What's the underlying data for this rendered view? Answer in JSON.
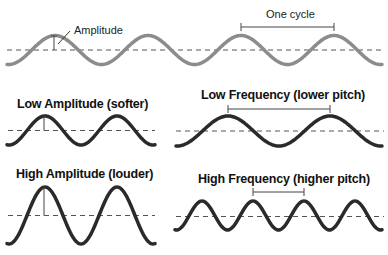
{
  "diagram": {
    "colors": {
      "reference_wave": "#8c8c8c",
      "example_wave": "#2a2a2a",
      "baseline": "#555555",
      "marker": "#444444"
    },
    "reference": {
      "amplitude_label": "Amplitude",
      "cycle_label": "One cycle",
      "wave": {
        "x0": 7,
        "x1": 382,
        "mid_y": 50,
        "amp": 14.5,
        "period": 93,
        "peak_x": 55
      }
    },
    "panels": [
      {
        "id": "low-amplitude",
        "title": "Low Amplitude (softer)",
        "wave": {
          "x0": 7,
          "x1": 155,
          "mid_y": 130.5,
          "amp": 14.5,
          "period": 72,
          "peak_x": 45
        },
        "marker": "amplitude"
      },
      {
        "id": "low-frequency",
        "title": "Low Frequency (lower pitch)",
        "wave": {
          "x0": 176,
          "x1": 382,
          "mid_y": 131,
          "amp": 15,
          "period": 102,
          "peak_x": 228
        },
        "marker": "cycle"
      },
      {
        "id": "high-amplitude",
        "title": "High Amplitude (louder)",
        "wave": {
          "x0": 7,
          "x1": 155,
          "mid_y": 215.5,
          "amp": 28.5,
          "period": 72,
          "peak_x": 45
        },
        "marker": "amplitude"
      },
      {
        "id": "high-frequency",
        "title": "High Frequency (higher pitch)",
        "wave": {
          "x0": 175,
          "x1": 382,
          "mid_y": 215.5,
          "amp": 14.5,
          "period": 51,
          "peak_x": 202
        },
        "marker": "cycle"
      }
    ]
  }
}
